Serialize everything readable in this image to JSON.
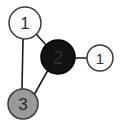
{
  "diagram": {
    "background_color": "#ffffff",
    "edge_color": "#1a1a1a",
    "nodes": [
      {
        "id": "node-1-top-left",
        "label": "1",
        "cx": 25,
        "cy": 23,
        "r": 16,
        "fill": "#fbfbfb",
        "stroke": "#3a3a3a",
        "label_color": "#333333",
        "label_size": 17
      },
      {
        "id": "node-2-center",
        "label": "2",
        "cx": 58,
        "cy": 57,
        "r": 17,
        "fill": "#121212",
        "stroke": "#000000",
        "label_color": "#2e2e2e",
        "label_size": 18
      },
      {
        "id": "node-1-right",
        "label": "1",
        "cx": 100,
        "cy": 58,
        "r": 13,
        "fill": "#fcfcfc",
        "stroke": "#3a3a3a",
        "label_color": "#333333",
        "label_size": 15
      },
      {
        "id": "node-3-bottom-left",
        "label": "3",
        "cx": 23,
        "cy": 104,
        "r": 15,
        "fill": "#9a9a9a",
        "stroke": "#3a3a3a",
        "label_color": "#2b2b2b",
        "label_size": 17
      }
    ],
    "edges": [
      {
        "id": "edge-1-2",
        "from": "node-1-top-left",
        "to": "node-2-center",
        "x1": 36,
        "y1": 34,
        "x2": 47,
        "y2": 46
      },
      {
        "id": "edge-1-3",
        "from": "node-1-top-left",
        "to": "node-3-bottom-left",
        "x1": 23,
        "y1": 39,
        "x2": 22,
        "y2": 89
      },
      {
        "id": "edge-3-2",
        "from": "node-3-bottom-left",
        "to": "node-2-center",
        "x1": 34,
        "y1": 95,
        "x2": 48,
        "y2": 70
      },
      {
        "id": "edge-2-1r",
        "from": "node-2-center",
        "to": "node-1-right",
        "x1": 75,
        "y1": 58,
        "x2": 87,
        "y2": 58
      }
    ]
  }
}
